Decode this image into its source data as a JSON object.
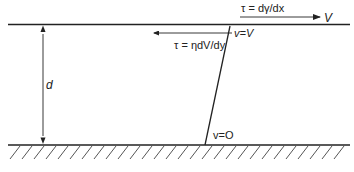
{
  "diagram": {
    "labels": {
      "top_shear": "τ = dγ/dx",
      "top_velocity": "V",
      "viscous_shear": "τ = ηdV/dy",
      "v_top": "v=V",
      "v_bottom": "v=O",
      "gap": "d"
    },
    "colors": {
      "line": "#222222",
      "hatch": "#555555",
      "background": "#ffffff"
    }
  }
}
